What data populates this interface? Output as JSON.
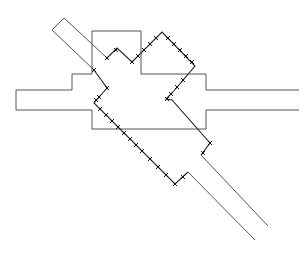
{
  "diagram": {
    "colors": {
      "background": "#ffffff",
      "outline": "#555555",
      "path": "#222222",
      "marker": "#111111"
    },
    "outline_polylines": [
      {
        "name": "left-pipe-top",
        "points": [
          [
            16,
            90
          ],
          [
            72,
            90
          ],
          [
            72,
            74
          ],
          [
            92,
            74
          ]
        ]
      },
      {
        "name": "left-pipe-bottom",
        "points": [
          [
            16,
            110
          ],
          [
            92,
            110
          ],
          [
            92,
            129
          ],
          [
            206,
            129
          ],
          [
            206,
            110
          ],
          [
            299,
            110
          ]
        ]
      },
      {
        "name": "left-pipe-end",
        "points": [
          [
            16,
            90
          ],
          [
            16,
            110
          ]
        ]
      },
      {
        "name": "top-box",
        "points": [
          [
            92,
            74
          ],
          [
            92,
            31
          ],
          [
            141,
            31
          ],
          [
            141,
            74
          ],
          [
            206,
            74
          ],
          [
            206,
            90
          ],
          [
            299,
            90
          ]
        ]
      }
    ],
    "tube_lines": [
      {
        "name": "upper-tube-outer",
        "points": [
          [
            107,
            58
          ],
          [
            64,
            18
          ],
          [
            52,
            30
          ],
          [
            94,
            70
          ]
        ]
      },
      {
        "name": "lower-tube-left",
        "points": [
          [
            188,
            172
          ],
          [
            255,
            240
          ]
        ]
      },
      {
        "name": "lower-tube-right",
        "points": [
          [
            201,
            155
          ],
          [
            268,
            226
          ]
        ]
      }
    ],
    "crossed_path": {
      "points": [
        [
          107,
          58
        ],
        [
          117,
          48
        ],
        [
          132,
          62
        ],
        [
          162,
          32
        ],
        [
          195,
          66
        ],
        [
          173,
          92
        ],
        [
          166,
          99
        ],
        [
          172,
          100
        ],
        [
          210,
          143
        ],
        [
          201,
          155
        ]
      ],
      "points_lower": [
        [
          94,
          70
        ],
        [
          107,
          88
        ],
        [
          94,
          103
        ],
        [
          175,
          184
        ],
        [
          188,
          172
        ]
      ]
    },
    "markers": [
      [
        94,
        70
      ],
      [
        107,
        58
      ],
      [
        116,
        50
      ],
      [
        132,
        62
      ],
      [
        138,
        56
      ],
      [
        144,
        50
      ],
      [
        150,
        44
      ],
      [
        156,
        38
      ],
      [
        168,
        38
      ],
      [
        174,
        44
      ],
      [
        180,
        50
      ],
      [
        186,
        56
      ],
      [
        192,
        62
      ],
      [
        183,
        80
      ],
      [
        177,
        87
      ],
      [
        171,
        94
      ],
      [
        167,
        99
      ],
      [
        107,
        88
      ],
      [
        99,
        97
      ],
      [
        96,
        100
      ],
      [
        100,
        109
      ],
      [
        106,
        115
      ],
      [
        112,
        121
      ],
      [
        118,
        127
      ],
      [
        124,
        133
      ],
      [
        130,
        139
      ],
      [
        136,
        145
      ],
      [
        142,
        151
      ],
      [
        150,
        159
      ],
      [
        158,
        167
      ],
      [
        166,
        175
      ],
      [
        175,
        184
      ],
      [
        183,
        177
      ],
      [
        210,
        143
      ],
      [
        203,
        153
      ]
    ]
  }
}
